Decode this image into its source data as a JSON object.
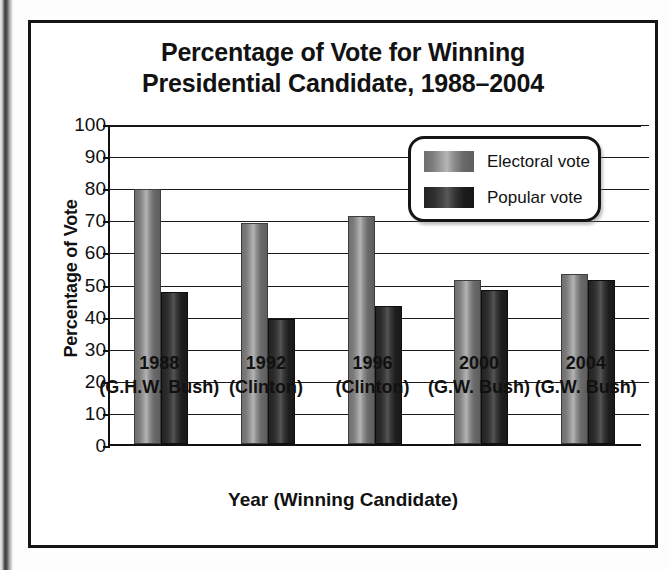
{
  "chart_data": {
    "type": "bar",
    "title": "Percentage of Vote for Winning Presidential Candidate, 1988–2004",
    "title_lines": [
      "Percentage of Vote for Winning",
      "Presidential Candidate, 1988–2004"
    ],
    "xlabel": "Year (Winning Candidate)",
    "ylabel": "Percentage of Vote",
    "ylim": [
      0,
      100
    ],
    "ytick_step": 10,
    "yticks": [
      100,
      90,
      80,
      70,
      60,
      50,
      40,
      30,
      20,
      10,
      0
    ],
    "grid": true,
    "legend_position": "inside top-right",
    "categories": [
      "1988",
      "1992",
      "1996",
      "2000",
      "2004"
    ],
    "category_sublabels": [
      "(G.H.W. Bush)",
      "(Clinton)",
      "(Clinton)",
      "(G.W. Bush)",
      "(G.W. Bush)"
    ],
    "series": [
      {
        "name": "Electoral vote",
        "color": "#8b8b8b",
        "values": [
          79.5,
          69,
          71,
          51,
          53
        ]
      },
      {
        "name": "Popular vote",
        "color": "#2a2a2a",
        "values": [
          47.5,
          39,
          43,
          48,
          51
        ]
      }
    ]
  },
  "legend": {
    "items": [
      {
        "label": "Electoral vote",
        "swatch": "electoral"
      },
      {
        "label": "Popular vote",
        "swatch": "popular"
      }
    ]
  }
}
